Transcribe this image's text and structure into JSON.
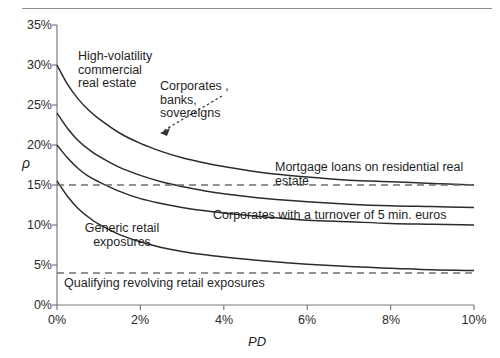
{
  "chart_data": {
    "type": "line",
    "title": "",
    "xlabel": "PD",
    "ylabel": "ρ",
    "xlim": [
      0,
      10
    ],
    "ylim": [
      0,
      35
    ],
    "grid": false,
    "legend": "annotations-inline",
    "x_unit": "%",
    "y_unit": "%",
    "xticks": [
      "0%",
      "2%",
      "4%",
      "6%",
      "8%",
      "10%"
    ],
    "xtick_values": [
      0,
      2,
      4,
      6,
      8,
      10
    ],
    "yticks": [
      "0%",
      "5%",
      "10%",
      "15%",
      "20%",
      "25%",
      "30%",
      "35%"
    ],
    "ytick_values": [
      0,
      5,
      10,
      15,
      20,
      25,
      30,
      35
    ],
    "x": [
      0,
      0.25,
      0.5,
      0.75,
      1,
      1.5,
      2,
      2.5,
      3,
      3.5,
      4,
      5,
      6,
      7,
      8,
      9,
      10
    ],
    "series": [
      {
        "name": "High-volatility commercial real estate",
        "style": "solid",
        "values": [
          30.0,
          27.6,
          25.8,
          24.4,
          23.3,
          21.5,
          20.2,
          19.2,
          18.4,
          17.8,
          17.3,
          16.5,
          16.0,
          15.6,
          15.4,
          15.2,
          15.0
        ]
      },
      {
        "name": "Corporates , banks, sovereigns",
        "style": "solid",
        "values": [
          24.0,
          22.1,
          20.6,
          19.5,
          18.6,
          17.2,
          16.2,
          15.4,
          14.8,
          14.3,
          13.9,
          13.3,
          12.9,
          12.6,
          12.4,
          12.3,
          12.2
        ]
      },
      {
        "name": "Corporates with a turnover of 5 min. euros",
        "style": "solid",
        "values": [
          20.0,
          18.4,
          17.1,
          16.1,
          15.4,
          14.2,
          13.3,
          12.7,
          12.2,
          11.8,
          11.5,
          11.0,
          10.6,
          10.4,
          10.2,
          10.1,
          10.0
        ]
      },
      {
        "name": "Generic retail exposures",
        "style": "solid",
        "values": [
          15.5,
          13.6,
          12.1,
          11.0,
          10.1,
          8.8,
          7.9,
          7.2,
          6.7,
          6.3,
          6.0,
          5.5,
          5.1,
          4.8,
          4.6,
          4.4,
          4.3
        ]
      },
      {
        "name": "Mortgage loans on residential real estate",
        "style": "dashed",
        "constant": 15.0,
        "values": [
          15,
          15,
          15,
          15,
          15,
          15,
          15,
          15,
          15,
          15,
          15,
          15,
          15,
          15,
          15,
          15,
          15
        ]
      },
      {
        "name": "Qualifying revolving retail exposures",
        "style": "dashed",
        "constant": 4.0,
        "values": [
          4,
          4,
          4,
          4,
          4,
          4,
          4,
          4,
          4,
          4,
          4,
          4,
          4,
          4,
          4,
          4,
          4
        ]
      }
    ],
    "annotations": [
      {
        "text": "High-volatility\ncommercial\nreal estate",
        "x": 0.72,
        "y": 32.0
      },
      {
        "text": "Corporates ,\nbanks,\nsovereigns",
        "x": 2.45,
        "y": 28.4,
        "leader": "dotted-arrow"
      },
      {
        "text": "Mortgage loans on residential real estate",
        "x": 5.4,
        "y": 16.5
      },
      {
        "text": "Corporates with a turnover of 5 min. euros",
        "x": 5.4,
        "y": 10.8
      },
      {
        "text": "Generic retail exposures",
        "x": 1.0,
        "y": 9.3
      },
      {
        "text": "Qualifying revolving retail exposures",
        "x": 0.55,
        "y": 2.6
      }
    ],
    "colors": {
      "curve": "#2b2b2b",
      "dashed": "#6f6f6f",
      "axis": "#6f6f6f",
      "text": "#1f1f1f",
      "background": "#ffffff"
    }
  },
  "axes": {
    "y_title": "ρ",
    "x_title": "PD",
    "ytick_labels": [
      "35%",
      "30%",
      "25%",
      "20%",
      "15%",
      "10%",
      "5%",
      "0%"
    ],
    "xtick_labels": [
      "0%",
      "2%",
      "4%",
      "6%",
      "8%",
      "10%"
    ]
  },
  "labels": {
    "hvcre": "High-volatility\ncommercial\nreal estate",
    "corporates_banks_sovereigns": "Corporates ,\nbanks,\nsovereigns",
    "mortgage": "Mortgage loans on residential real estate",
    "corporates_turnover": "Corporates with a turnover of 5 min. euros",
    "generic_retail": "Generic retail\nexposures",
    "qrre": "Qualifying revolving retail exposures"
  }
}
